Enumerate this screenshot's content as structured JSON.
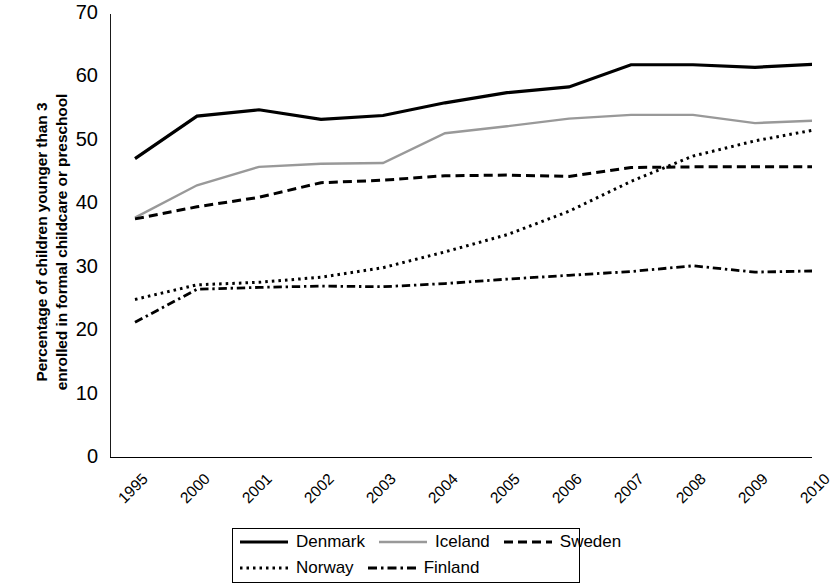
{
  "chart_data": {
    "type": "line",
    "title": "",
    "xlabel": "",
    "ylabel": "Percentage of children younger than 3 enrolled in formal childcare or preschool",
    "ylabel_line1": "Percentage of children younger than 3",
    "ylabel_line2": "enrolled in formal childcare or preschool",
    "categories": [
      "1995",
      "2000",
      "2001",
      "2002",
      "2003",
      "2004",
      "2005",
      "2006",
      "2007",
      "2008",
      "2009",
      "2010"
    ],
    "x_tick_labels": [
      "1995",
      "2000",
      "2001",
      "2002",
      "2003",
      "2004",
      "2005",
      "2006",
      "2007",
      "2008",
      "2009",
      "2010"
    ],
    "y_tick_labels": [
      "0",
      "10",
      "20",
      "30",
      "40",
      "50",
      "60",
      "70"
    ],
    "y_ticks": [
      0,
      10,
      20,
      30,
      40,
      50,
      60,
      70
    ],
    "ylim": [
      0,
      70
    ],
    "grid": false,
    "legend_position": "bottom",
    "series": [
      {
        "name": "Denmark",
        "style": "solid",
        "color": "#000000",
        "width": 3.2,
        "values": [
          47.2,
          53.9,
          54.9,
          53.4,
          54.0,
          56.0,
          57.6,
          58.5,
          62.0,
          62.0,
          61.6,
          62.1
        ]
      },
      {
        "name": "Iceland",
        "style": "solid",
        "color": "#999999",
        "width": 2.4,
        "values": [
          37.9,
          43.0,
          45.9,
          46.4,
          46.5,
          51.2,
          52.3,
          53.5,
          54.1,
          54.1,
          52.8,
          53.2
        ]
      },
      {
        "name": "Sweden",
        "style": "dashed",
        "color": "#000000",
        "width": 3.0,
        "values": [
          37.7,
          39.6,
          41.1,
          43.4,
          43.8,
          44.5,
          44.6,
          44.4,
          45.8,
          45.9,
          45.9,
          45.9
        ]
      },
      {
        "name": "Norway",
        "style": "dotted",
        "color": "#000000",
        "width": 3.0,
        "values": [
          25.0,
          27.3,
          27.7,
          28.5,
          30.0,
          32.5,
          35.2,
          38.9,
          43.6,
          47.6,
          50.0,
          51.8
        ]
      },
      {
        "name": "Finland",
        "style": "dashdot",
        "color": "#000000",
        "width": 2.8,
        "values": [
          21.4,
          26.6,
          26.9,
          27.1,
          27.0,
          27.5,
          28.2,
          28.8,
          29.4,
          30.3,
          29.3,
          29.5
        ]
      }
    ]
  },
  "legend": {
    "entries": [
      {
        "label": "Denmark",
        "style": "solid",
        "color": "#000000"
      },
      {
        "label": "Iceland",
        "style": "solid",
        "color": "#999999"
      },
      {
        "label": "Sweden",
        "style": "dashed",
        "color": "#000000"
      },
      {
        "label": "Norway",
        "style": "dotted",
        "color": "#000000"
      },
      {
        "label": "Finland",
        "style": "dashdot",
        "color": "#000000"
      }
    ]
  }
}
